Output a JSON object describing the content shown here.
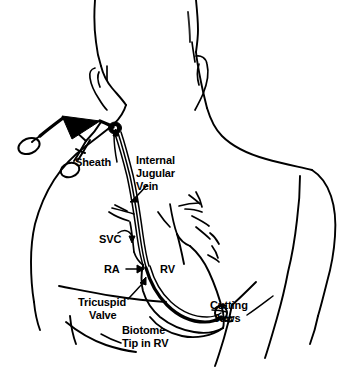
{
  "figure": {
    "style": "black-and-white line drawing",
    "colors": {
      "ink": "#000000",
      "background": "#ffffff"
    }
  },
  "labels": {
    "sheath": "Sheath",
    "internal_jugular_vein_line1": "Internal",
    "internal_jugular_vein_line2": "Jugular",
    "internal_jugular_vein_line3": "Vein",
    "svc": "SVC",
    "ra": "RA",
    "ra_arrow": "→",
    "rv": "RV",
    "tricuspid_valve_line1": "Tricuspid",
    "tricuspid_valve_line2": "Valve",
    "cutting_jaws_line1": "Cutting",
    "cutting_jaws_line2": "Jaws",
    "biotome_line1": "Biotome",
    "biotome_line2": "Tip in RV"
  },
  "parts": {
    "torso": "patient-torso-outline",
    "head": "patient-head-outline",
    "left_ear": "left-ear-outline",
    "right_ear": "right-ear-outline",
    "clavicle": "clavicle-line",
    "left_pectoral": "left-pectoral-line",
    "right_pectoral": "right-pectoral-line",
    "heart": "heart-outline",
    "great_vessels": "great-vessels",
    "svc_vessel": "superior-vena-cava",
    "catheter": "biotome-catheter",
    "sheath_hub": "sheath-hub",
    "clamp": "hemostat-clamp",
    "jaws": "cutting-jaws-tip"
  }
}
